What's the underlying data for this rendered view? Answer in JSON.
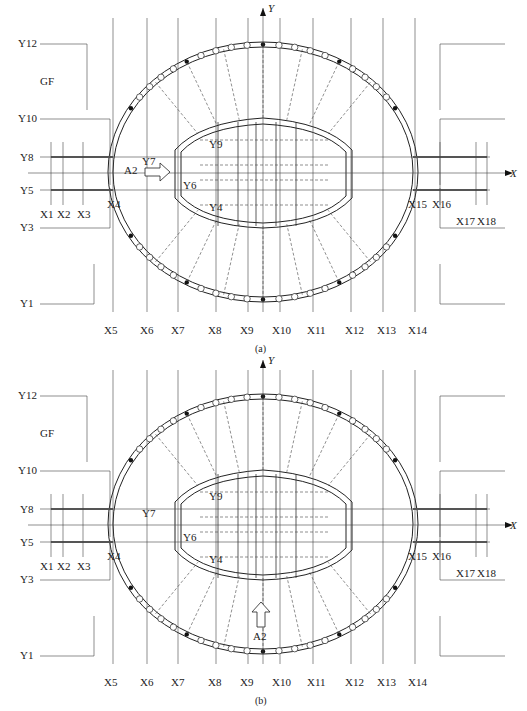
{
  "figures": [
    {
      "id": "a",
      "caption": "(a)",
      "axis_x": "X",
      "axis_y": "Y",
      "zone_label": "GF",
      "arrow_label": "A2",
      "arrow_direction": "right",
      "y_labels": {
        "Y12": "Y12",
        "Y10": "Y10",
        "Y8": "Y8",
        "Y5": "Y5",
        "Y3": "Y3",
        "Y1": "Y1",
        "Y9": "Y9",
        "Y7": "Y7",
        "Y6": "Y6",
        "Y4": "Y4"
      },
      "x_labels": [
        "X1",
        "X2",
        "X3",
        "X4",
        "X5",
        "X6",
        "X7",
        "X8",
        "X9",
        "X10",
        "X11",
        "X12",
        "X13",
        "X14",
        "X15",
        "X16",
        "X17",
        "X18"
      ]
    },
    {
      "id": "b",
      "caption": "(b)",
      "axis_x": "X",
      "axis_y": "Y",
      "zone_label": "GF",
      "arrow_label": "A2",
      "arrow_direction": "up",
      "y_labels": {
        "Y12": "Y12",
        "Y10": "Y10",
        "Y8": "Y8",
        "Y5": "Y5",
        "Y3": "Y3",
        "Y1": "Y1",
        "Y9": "Y9",
        "Y7": "Y7",
        "Y6": "Y6",
        "Y4": "Y4"
      },
      "x_labels": [
        "X1",
        "X2",
        "X3",
        "X4",
        "X5",
        "X6",
        "X7",
        "X8",
        "X9",
        "X10",
        "X11",
        "X12",
        "X13",
        "X14",
        "X15",
        "X16",
        "X17",
        "X18"
      ]
    }
  ]
}
